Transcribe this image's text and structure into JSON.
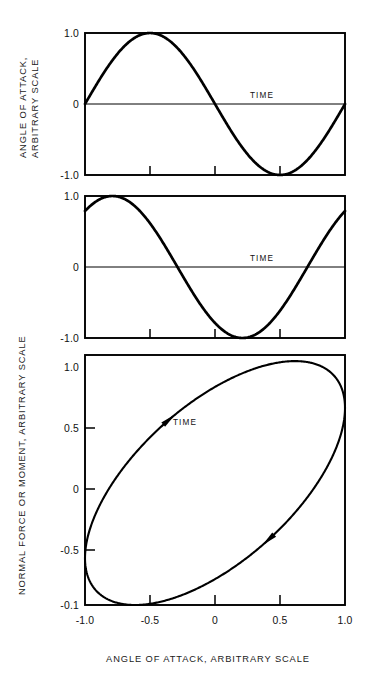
{
  "figure": {
    "xlabel": "ANGLE OF ATTACK, ARBITRARY SCALE",
    "ylabel_top": "ANGLE OF ATTACK,",
    "ylabel_top_line2": "ARBITRARY SCALE",
    "ylabel_lower": "NORMAL FORCE OR MOMENT, ARBITRARY SCALE",
    "line_color": "#000000",
    "background_color": "#ffffff"
  },
  "chart_data": [
    {
      "type": "line",
      "panel": "top",
      "title": "",
      "xlabel": "",
      "ylabel": "ANGLE OF ATTACK, ARBITRARY SCALE",
      "annotation": "TIME",
      "ylim": [
        -1.0,
        1.0
      ],
      "xlim": [
        0,
        1
      ],
      "ytick_labels": [
        "1.0",
        "0",
        "-1.0"
      ],
      "ytick_values": [
        1.0,
        0,
        -1.0
      ],
      "xtick_values": [
        0.25,
        0.5,
        0.75
      ],
      "xtick_labels": [
        "",
        "",
        ""
      ],
      "grid": false,
      "legend": "none",
      "description": "sine wave, one full cycle, amplitude 1.0, starting at zero rising",
      "series": [
        {
          "name": "angle of attack",
          "waveform": "sine",
          "amplitude": 1.0,
          "phase_deg": 0,
          "cycles": 1,
          "x": [
            0,
            0.05,
            0.1,
            0.15,
            0.2,
            0.25,
            0.3,
            0.35,
            0.4,
            0.45,
            0.5,
            0.55,
            0.6,
            0.65,
            0.7,
            0.75,
            0.8,
            0.85,
            0.9,
            0.95,
            1.0
          ],
          "values": [
            0,
            0.309,
            0.588,
            0.809,
            0.951,
            1.0,
            0.951,
            0.809,
            0.588,
            0.309,
            0,
            -0.309,
            -0.588,
            -0.809,
            -0.951,
            -1.0,
            -0.951,
            -0.809,
            -0.588,
            -0.309,
            0
          ]
        }
      ]
    },
    {
      "type": "line",
      "panel": "middle",
      "title": "",
      "xlabel": "",
      "ylabel": "NORMAL FORCE OR MOMENT, ARBITRARY SCALE",
      "annotation": "TIME",
      "ylim": [
        -1.0,
        1.0
      ],
      "xlim": [
        0,
        1
      ],
      "ytick_labels": [
        "1.0",
        "0",
        "-1.0"
      ],
      "ytick_values": [
        1.0,
        0,
        -1.0
      ],
      "xtick_values": [
        0.25,
        0.5,
        0.75
      ],
      "xtick_labels": [
        "",
        "",
        ""
      ],
      "grid": false,
      "legend": "none",
      "description": "phase-lead sine wave, amplitude 1.0, leading the angle of attack by about 50 degrees",
      "series": [
        {
          "name": "normal force or moment",
          "waveform": "sine",
          "amplitude": 1.0,
          "phase_deg": 52,
          "cycles": 1,
          "x": [
            0,
            0.05,
            0.1,
            0.15,
            0.2,
            0.25,
            0.3,
            0.35,
            0.4,
            0.45,
            0.5,
            0.55,
            0.6,
            0.65,
            0.7,
            0.75,
            0.8,
            0.85,
            0.9,
            0.95,
            1.0
          ],
          "values": [
            0.788,
            0.961,
            1.0,
            0.906,
            0.695,
            0.397,
            0.045,
            -0.314,
            -0.637,
            -0.875,
            -0.995,
            -0.982,
            -0.839,
            -0.583,
            -0.25,
            0.111,
            0.454,
            0.738,
            0.927,
            0.998,
            0.788
          ]
        }
      ]
    },
    {
      "type": "line",
      "panel": "bottom",
      "title": "",
      "xlabel": "ANGLE OF ATTACK, ARBITRARY SCALE",
      "ylabel": "NORMAL FORCE OR MOMENT, ARBITRARY SCALE",
      "annotation": "TIME",
      "xlim": [
        -1.0,
        1.0
      ],
      "ylim": [
        -1.0,
        1.05
      ],
      "xtick_values": [
        -1.0,
        -0.5,
        0,
        0.5,
        1.0
      ],
      "xtick_labels": [
        "-1.0",
        "-0.5",
        "0",
        "0.5",
        "1.0"
      ],
      "ytick_values": [
        1.0,
        0.5,
        0,
        -0.5,
        -1.0
      ],
      "ytick_labels": [
        "1.0",
        "0.5",
        "0",
        "-0.5",
        "-0.1"
      ],
      "grid": false,
      "legend": "none",
      "description": "counter-clockwise hysteresis loop formed by plotting normal force against angle of attack; narrow elongated ellipse tilted along the positive diagonal",
      "loop": {
        "direction": "counter-clockwise",
        "tilt": "positive diagonal",
        "semi_major": 1.0,
        "semi_minor": 0.12,
        "rotation_deg": 43,
        "arrows": [
          {
            "at_x": -0.38,
            "at_y": 0.56,
            "direction": "up-right"
          },
          {
            "at_x": 0.33,
            "at_y": -0.38,
            "direction": "down-left"
          }
        ]
      },
      "series": [
        {
          "name": "force vs angle hysteresis loop",
          "x": [
            0,
            0.309,
            0.588,
            0.809,
            0.951,
            1.0,
            0.951,
            0.809,
            0.588,
            0.309,
            0,
            -0.309,
            -0.588,
            -0.809,
            -0.951,
            -1.0,
            -0.951,
            -0.809,
            -0.588,
            -0.309,
            0
          ],
          "values": [
            0.788,
            0.961,
            1.0,
            0.906,
            0.695,
            0.397,
            0.045,
            -0.314,
            -0.637,
            -0.875,
            -0.995,
            -0.982,
            -0.839,
            -0.583,
            -0.25,
            0.111,
            0.454,
            0.738,
            0.927,
            0.998,
            0.788
          ]
        }
      ]
    }
  ]
}
